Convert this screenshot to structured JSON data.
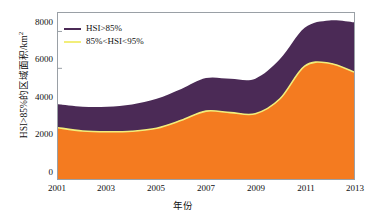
{
  "chart_data": {
    "type": "area",
    "title": "",
    "subtitle": "",
    "xlabel": "年份",
    "ylabel": "HSI>85%的区域面积/km²",
    "ylabel_main": "HSI>85%的区域面积/km",
    "ylabel_sup": "2",
    "stacked": true,
    "grid": false,
    "legend_position": "top-left",
    "xlim": [
      2001,
      2013
    ],
    "ylim": [
      0,
      9000
    ],
    "xticks": [
      2001,
      2003,
      2005,
      2007,
      2009,
      2011,
      2013
    ],
    "xtick_labels": [
      "2001",
      "2003",
      "2005",
      "2007",
      "2009",
      "2011",
      "2013"
    ],
    "yticks": [
      0,
      2000,
      4000,
      6000,
      8000
    ],
    "ytick_labels": [
      "0",
      "2000",
      "4000",
      "6000",
      "8000"
    ],
    "x": [
      2001,
      2002,
      2003,
      2004,
      2005,
      2006,
      2007,
      2008,
      2009,
      2010,
      2011,
      2012,
      2013
    ],
    "series": [
      {
        "name": "85%<HSI<95%",
        "color": "#F47B20",
        "legend_marker_color": "#F2EE7A",
        "legend_label": "85%<HSI<95%",
        "values": [
          2780,
          2600,
          2560,
          2590,
          2750,
          3180,
          3680,
          3600,
          3540,
          4350,
          6120,
          6280,
          5800
        ]
      },
      {
        "name": "HSI>85%",
        "color": "#4B2A56",
        "legend_marker_color": "#4B2A56",
        "legend_label": "HSI>85%",
        "values": [
          1270,
          1320,
          1360,
          1450,
          1600,
          1700,
          1790,
          1830,
          1900,
          2150,
          2080,
          2320,
          2700
        ]
      }
    ],
    "stack_totals": [
      4050,
      3920,
      3920,
      4040,
      4350,
      4880,
      5470,
      5430,
      5440,
      6500,
      8200,
      8600,
      8500
    ],
    "colors": {
      "band_upper": "#4B2A56",
      "band_lower": "#F47B20",
      "lower_edge": "#F2EE7A",
      "axis": "#9aa0a6",
      "text": "#111111",
      "background": "#ffffff"
    }
  },
  "legend": {
    "items": [
      {
        "label": "HSI>85%",
        "marker_color": "#4B2A56"
      },
      {
        "label": "85%<HSI<95%",
        "marker_color": "#F2EE7A"
      }
    ]
  }
}
